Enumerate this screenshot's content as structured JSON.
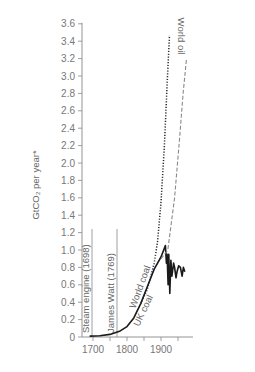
{
  "chart_data": {
    "type": "line",
    "title": "",
    "xlabel": "",
    "ylabel": "GtCO₂ per year*",
    "xlim": [
      1668,
      1993
    ],
    "ylim": [
      0,
      3.6
    ],
    "x_ticks": [
      1700,
      1800,
      1900
    ],
    "x_minor_ticks": [
      1700,
      1750,
      1800,
      1850,
      1900,
      1950
    ],
    "y_ticks": [
      "0",
      "0.2",
      "0.4",
      "0.6",
      "0.8",
      "1.0",
      "1.2",
      "1.4",
      "1.6",
      "1.8",
      "2.0",
      "2.2",
      "2.4",
      "2.6",
      "2.8",
      "3.0",
      "3.2",
      "3.4",
      "3.6"
    ],
    "grid": false,
    "legend": "inline labels",
    "series": [
      {
        "name": "UK coal",
        "style": "solid",
        "points": [
          [
            1690,
            0.01
          ],
          [
            1720,
            0.015
          ],
          [
            1750,
            0.03
          ],
          [
            1780,
            0.07
          ],
          [
            1800,
            0.12
          ],
          [
            1820,
            0.22
          ],
          [
            1840,
            0.38
          ],
          [
            1860,
            0.58
          ],
          [
            1880,
            0.78
          ],
          [
            1900,
            0.92
          ],
          [
            1913,
            1.05
          ],
          [
            1916,
            0.85
          ],
          [
            1918,
            0.95
          ],
          [
            1921,
            0.6
          ],
          [
            1923,
            0.95
          ],
          [
            1926,
            0.5
          ],
          [
            1929,
            0.88
          ],
          [
            1932,
            0.7
          ],
          [
            1937,
            0.85
          ],
          [
            1940,
            0.8
          ],
          [
            1944,
            0.68
          ],
          [
            1947,
            0.75
          ],
          [
            1952,
            0.82
          ],
          [
            1957,
            0.8
          ],
          [
            1962,
            0.7
          ],
          [
            1966,
            0.8
          ],
          [
            1970,
            0.75
          ]
        ]
      },
      {
        "name": "World coal",
        "style": "dotted",
        "points": [
          [
            1840,
            0.38
          ],
          [
            1860,
            0.55
          ],
          [
            1880,
            0.85
          ],
          [
            1890,
            1.1
          ],
          [
            1900,
            1.55
          ],
          [
            1910,
            2.2
          ],
          [
            1918,
            2.9
          ],
          [
            1925,
            3.47
          ]
        ]
      },
      {
        "name": "World oil",
        "style": "dashed",
        "points": [
          [
            1900,
            0.9
          ],
          [
            1920,
            1.0
          ],
          [
            1940,
            1.6
          ],
          [
            1955,
            2.3
          ],
          [
            1965,
            2.8
          ],
          [
            1975,
            3.2
          ]
        ]
      }
    ],
    "annotations": [
      {
        "text": "Steam engine (1698)",
        "x": 1698,
        "type": "vertical-line"
      },
      {
        "text": "James Watt (1769)",
        "x": 1769,
        "type": "vertical-line"
      },
      {
        "text": "World coal",
        "type": "series-label"
      },
      {
        "text": "UK coal",
        "type": "series-label"
      },
      {
        "text": "World oil",
        "type": "series-label"
      }
    ]
  },
  "labels": {
    "ylabel": "GtCO₂ per year*",
    "steam": "Steam engine (1698)",
    "watt": "James Watt (1769)",
    "world_coal": "World coal",
    "uk_coal": "UK coal",
    "world_oil": "World oil"
  },
  "colors": {
    "axis": "#888888",
    "uk_coal": "#1a1a1a",
    "world_coal": "#2a2a2a",
    "world_oil": "#8a8a8a"
  }
}
